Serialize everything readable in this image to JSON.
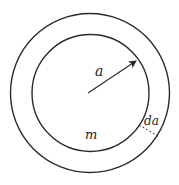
{
  "diagram": {
    "type": "concentric-circles",
    "outer_circle": {
      "cx": 90,
      "cy": 93,
      "r": 79.5
    },
    "inner_circle": {
      "cx": 90.5,
      "cy": 93,
      "r": 58.5
    },
    "radius_arrow": {
      "x1": 88,
      "y1": 93,
      "x2": 137,
      "y2": 60
    },
    "thickness_dash": {
      "x1": 139,
      "y1": 125,
      "x2": 158,
      "y2": 136
    },
    "labels": {
      "radius": "a",
      "mass": "m",
      "thickness": "da"
    },
    "colors": {
      "stroke": "#2a2a2a",
      "background": "#ffffff"
    }
  }
}
